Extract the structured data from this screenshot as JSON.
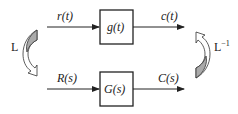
{
  "diagram": {
    "time_domain": {
      "input_label": "r(t)",
      "block_label": "g(t)",
      "output_label": "c(t)"
    },
    "s_domain": {
      "input_label": "R(s)",
      "block_label": "G(s)",
      "output_label": "C(s)"
    },
    "left_transform": {
      "label": "L",
      "direction": "down"
    },
    "right_transform": {
      "label": "L",
      "superscript": "−1",
      "direction": "up"
    },
    "colors": {
      "line": "#222222",
      "arrow_fill": "#aaaaaa",
      "background": "#ffffff"
    }
  }
}
